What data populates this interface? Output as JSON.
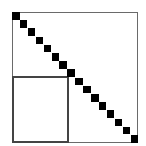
{
  "diagram": {
    "type": "matrix-sparsity-pattern",
    "outer_frame": {
      "x": 12,
      "y": 12,
      "width": 126,
      "height": 131,
      "color": "#6a6a6a"
    },
    "inner_rect": {
      "x": 12,
      "y": 76,
      "width": 57,
      "height": 67,
      "color": "#444444"
    },
    "diagonal": {
      "count": 16,
      "start_x": 12,
      "start_y": 12,
      "step_x": 7.9,
      "step_y": 8.2,
      "size": 7.5,
      "color": "#000000"
    }
  }
}
